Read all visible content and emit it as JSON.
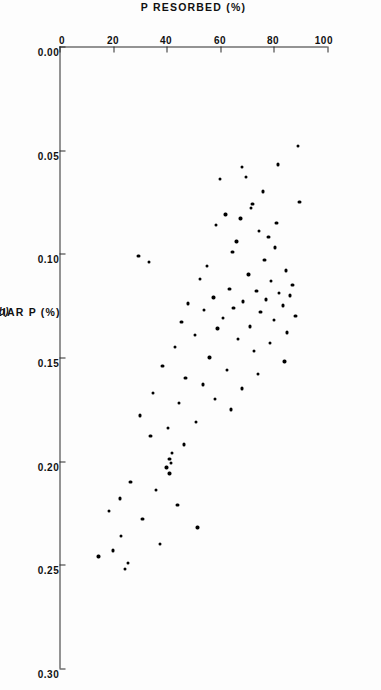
{
  "figure": {
    "panel_label": "(b)",
    "ink_color": "#000000",
    "axis_color": "#2b2b2b",
    "background_color": "#ffffff"
  },
  "chart_data": {
    "type": "scatter",
    "title": "",
    "xlabel": "FOLIAR P (%)",
    "ylabel": "P RESORBED (%)",
    "xlim": [
      0.0,
      0.3
    ],
    "ylim": [
      0,
      100
    ],
    "xticks": [
      "0.00",
      "0.05",
      "0.10",
      "0.15",
      "0.20",
      "0.25",
      "0.30"
    ],
    "xtick_values": [
      0.0,
      0.05,
      0.1,
      0.15,
      0.2,
      0.25,
      0.3
    ],
    "yticks": [
      "0",
      "20",
      "40",
      "60",
      "80",
      "100"
    ],
    "ytick_values": [
      0,
      20,
      40,
      60,
      80,
      100
    ],
    "grid": false,
    "legend": "none",
    "marker": "filled-circle",
    "points": [
      [
        0.048,
        89.0
      ],
      [
        0.057,
        81.5
      ],
      [
        0.058,
        68.0
      ],
      [
        0.063,
        69.5
      ],
      [
        0.064,
        60.0
      ],
      [
        0.07,
        76.0
      ],
      [
        0.075,
        89.5
      ],
      [
        0.076,
        72.0
      ],
      [
        0.078,
        71.5
      ],
      [
        0.081,
        62.0
      ],
      [
        0.083,
        67.5
      ],
      [
        0.085,
        81.0
      ],
      [
        0.086,
        58.5
      ],
      [
        0.089,
        74.5
      ],
      [
        0.092,
        78.0
      ],
      [
        0.094,
        66.0
      ],
      [
        0.097,
        80.5
      ],
      [
        0.099,
        64.5
      ],
      [
        0.101,
        29.5
      ],
      [
        0.103,
        76.5
      ],
      [
        0.104,
        33.5
      ],
      [
        0.106,
        55.0
      ],
      [
        0.108,
        84.5
      ],
      [
        0.11,
        70.5
      ],
      [
        0.112,
        52.5
      ],
      [
        0.113,
        79.0
      ],
      [
        0.115,
        87.0
      ],
      [
        0.117,
        63.5
      ],
      [
        0.118,
        73.5
      ],
      [
        0.119,
        82.0
      ],
      [
        0.12,
        86.0
      ],
      [
        0.121,
        57.5
      ],
      [
        0.122,
        77.0
      ],
      [
        0.123,
        68.5
      ],
      [
        0.124,
        48.0
      ],
      [
        0.125,
        83.5
      ],
      [
        0.126,
        65.0
      ],
      [
        0.127,
        54.0
      ],
      [
        0.128,
        75.0
      ],
      [
        0.13,
        88.0
      ],
      [
        0.131,
        61.0
      ],
      [
        0.132,
        80.0
      ],
      [
        0.133,
        45.5
      ],
      [
        0.135,
        71.0
      ],
      [
        0.136,
        59.0
      ],
      [
        0.138,
        85.0
      ],
      [
        0.139,
        50.5
      ],
      [
        0.141,
        66.5
      ],
      [
        0.143,
        78.5
      ],
      [
        0.145,
        43.0
      ],
      [
        0.147,
        72.5
      ],
      [
        0.15,
        56.0
      ],
      [
        0.152,
        84.0
      ],
      [
        0.154,
        38.5
      ],
      [
        0.156,
        62.5
      ],
      [
        0.158,
        74.0
      ],
      [
        0.16,
        47.0
      ],
      [
        0.163,
        53.5
      ],
      [
        0.165,
        68.0
      ],
      [
        0.167,
        35.0
      ],
      [
        0.17,
        58.0
      ],
      [
        0.172,
        44.5
      ],
      [
        0.175,
        64.0
      ],
      [
        0.178,
        30.0
      ],
      [
        0.181,
        51.0
      ],
      [
        0.184,
        40.5
      ],
      [
        0.188,
        34.0
      ],
      [
        0.192,
        46.5
      ],
      [
        0.196,
        42.0
      ],
      [
        0.199,
        41.0
      ],
      [
        0.201,
        41.5
      ],
      [
        0.203,
        40.0
      ],
      [
        0.206,
        41.0
      ],
      [
        0.21,
        26.5
      ],
      [
        0.214,
        36.0
      ],
      [
        0.218,
        22.5
      ],
      [
        0.221,
        44.0
      ],
      [
        0.224,
        18.5
      ],
      [
        0.228,
        31.0
      ],
      [
        0.232,
        51.5
      ],
      [
        0.236,
        23.0
      ],
      [
        0.24,
        37.5
      ],
      [
        0.243,
        20.0
      ],
      [
        0.246,
        14.5
      ],
      [
        0.249,
        25.5
      ],
      [
        0.252,
        24.5
      ]
    ]
  }
}
